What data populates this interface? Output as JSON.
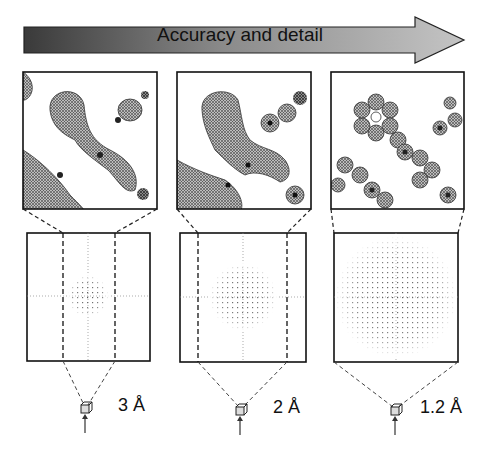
{
  "header_arrow": {
    "label": "Accuracy and detail",
    "gradient_start": "#3a3a3a",
    "gradient_end": "#bdbdbd"
  },
  "panels": [
    {
      "resolution_label": "3 Å",
      "map_detail": "low",
      "diffraction_extent": "small"
    },
    {
      "resolution_label": "2 Å",
      "map_detail": "medium",
      "diffraction_extent": "medium"
    },
    {
      "resolution_label": "1.2 Å",
      "map_detail": "high",
      "diffraction_extent": "large"
    }
  ]
}
